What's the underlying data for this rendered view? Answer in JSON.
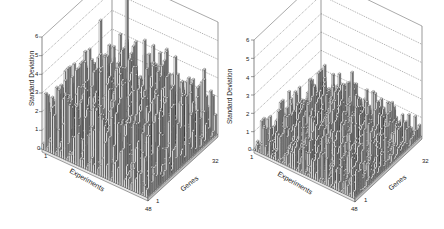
{
  "chart_data": [
    {
      "type": "bar3d",
      "title": "",
      "xlabel": "Experiments",
      "ylabel": "Genes",
      "zlabel": "Standard Deviation",
      "x_ticks": [
        "1",
        "48"
      ],
      "y_ticks": [
        "1",
        "32"
      ],
      "z_ticks": [
        "0",
        "1",
        "2",
        "3",
        "4",
        "5",
        "6"
      ],
      "zlim": [
        0,
        6
      ],
      "grid": "dotted horizontal on back walls",
      "n_experiments": 48,
      "n_genes": 32,
      "summary": "High variance: many bars between 1 and 4, frequent peaks above 4",
      "typical_range": [
        0.3,
        3.5
      ],
      "mean_height": 1.8,
      "max_value": 5.9,
      "notable_peaks": [
        {
          "experiment": 12,
          "gene": 28,
          "value": 5.9
        },
        {
          "experiment": 4,
          "gene": 24,
          "value": 4.6
        },
        {
          "experiment": 22,
          "gene": 26,
          "value": 4.3
        },
        {
          "experiment": 30,
          "gene": 22,
          "value": 3.8
        },
        {
          "experiment": 44,
          "gene": 8,
          "value": 3.0
        }
      ],
      "seed": 7
    },
    {
      "type": "bar3d",
      "title": "",
      "xlabel": "Experiments",
      "ylabel": "Genes",
      "zlabel": "Standard Deviation",
      "x_ticks": [
        "1",
        "48"
      ],
      "y_ticks": [
        "1",
        "32"
      ],
      "z_ticks": [
        "0",
        "1",
        "2",
        "3",
        "4",
        "5",
        "6"
      ],
      "zlim": [
        0,
        6
      ],
      "grid": "dotted horizontal on back walls",
      "n_experiments": 48,
      "n_genes": 32,
      "summary": "Low variance: most bars below 1.5, maximum near 2.4",
      "typical_range": [
        0.1,
        1.5
      ],
      "mean_height": 0.8,
      "max_value": 2.4,
      "notable_peaks": [
        {
          "experiment": 20,
          "gene": 28,
          "value": 2.4
        },
        {
          "experiment": 30,
          "gene": 20,
          "value": 1.9
        },
        {
          "experiment": 40,
          "gene": 14,
          "value": 1.9
        },
        {
          "experiment": 8,
          "gene": 22,
          "value": 1.6
        }
      ],
      "seed": 19
    }
  ],
  "panels": [
    {
      "geometry": {
        "origin": [
          42,
          149
        ],
        "zTop": [
          42,
          37
        ],
        "frontCorner": [
          148,
          198
        ],
        "backLeft": [
          100,
          130
        ],
        "backRight": [
          218,
          134
        ]
      },
      "labels": {
        "z_title": "Standard Deviation",
        "x_title": "Experiments",
        "y_title": "Genes",
        "z_ticks": [
          "0",
          "1",
          "2",
          "3",
          "4",
          "5",
          "6"
        ],
        "x_start": "1",
        "x_end": "48",
        "y_start": "1",
        "y_end": "32"
      }
    },
    {
      "geometry": {
        "origin": [
          32,
          150
        ],
        "zTop": [
          32,
          40
        ],
        "frontCorner": [
          133,
          199
        ],
        "backLeft": [
          84,
          131
        ],
        "backRight": [
          200,
          136
        ]
      },
      "labels": {
        "z_title": "Standard Deviation",
        "x_title": "Experiments",
        "y_title": "Genes",
        "z_ticks": [
          "0",
          "1",
          "2",
          "3",
          "4",
          "5",
          "6"
        ],
        "x_start": "1",
        "x_end": "48",
        "y_start": "1",
        "y_end": "32"
      }
    }
  ],
  "colors": {
    "bar_front": "#f2f2f2",
    "bar_side": "#7a7a7a",
    "bar_top": "#d0d0d0",
    "bar_edge": "#1a1a1a",
    "axis": "#555555",
    "grid": "#555555",
    "floor": "#bdbdbd"
  }
}
